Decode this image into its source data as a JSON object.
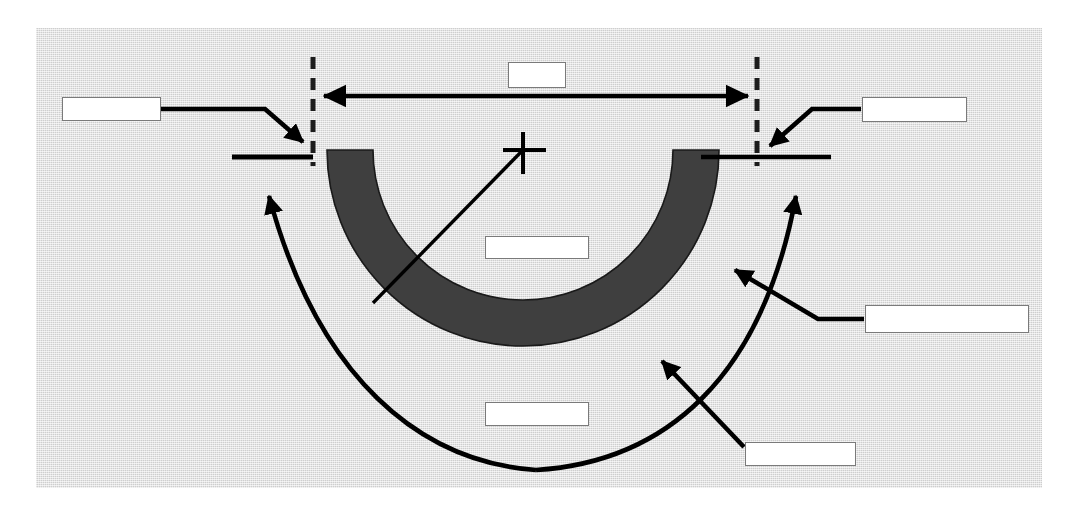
{
  "figure": {
    "type": "labeling-worksheet-diagram",
    "plate_background_color": "#dcdcdc",
    "page_background_color": "#ffffff",
    "band_fill_color": "#3f3f3f",
    "line_color": "#000000",
    "box_fill_color": "#ffffff",
    "box_border_color": "#7a7a7a"
  },
  "geometry": {
    "center_marker": {
      "name": "center-crosshair",
      "x": 523,
      "y": 150
    },
    "arc_band": {
      "center_x": 523,
      "center_y": 150,
      "inner_radius": 150,
      "outer_radius": 196,
      "start_angle_deg": 180,
      "end_angle_deg": 360,
      "description": "U-shaped dark gray circular band (half annulus) opening upward"
    },
    "left_dashed_line": {
      "x": 313,
      "y_top": 57,
      "y_bottom": 163
    },
    "right_dashed_line": {
      "x": 757,
      "y_top": 57,
      "y_bottom": 163
    },
    "left_tick": {
      "x1": 232,
      "x2": 312,
      "y": 157
    },
    "right_tick": {
      "x1": 700,
      "x2": 830,
      "y": 157
    },
    "span_arrow": {
      "x1": 320,
      "x2": 752,
      "y": 96,
      "heads": "both"
    },
    "radius_line": {
      "x1": 523,
      "y1": 150,
      "x2": 375,
      "y2": 302
    }
  },
  "labels": {
    "span_dimension": {
      "name": "span-dimension-box",
      "text": "",
      "x": 508,
      "y": 62,
      "w": 58,
      "h": 26
    },
    "left_springing": {
      "name": "left-springing-box",
      "text": "",
      "x": 62,
      "y": 97,
      "w": 99,
      "h": 24
    },
    "right_springing": {
      "name": "right-springing-box",
      "text": "",
      "x": 862,
      "y": 97,
      "w": 105,
      "h": 25
    },
    "radius_label": {
      "name": "radius-label-box",
      "text": "",
      "x": 485,
      "y": 236,
      "w": 104,
      "h": 23
    },
    "ring_outer": {
      "name": "outer-ring-label-box",
      "text": "",
      "x": 865,
      "y": 305,
      "w": 164,
      "h": 28
    },
    "rise_label": {
      "name": "rise-label-box",
      "text": "",
      "x": 485,
      "y": 402,
      "w": 104,
      "h": 24
    },
    "ring_inner": {
      "name": "inner-ring-label-box",
      "text": "",
      "x": 745,
      "y": 442,
      "w": 111,
      "h": 24
    }
  },
  "leaders": [
    {
      "name": "leader-left-springing",
      "from_box": "left_springing",
      "to": "left abutment / dashed line top"
    },
    {
      "name": "leader-right-springing",
      "from_box": "right_springing",
      "to": "right abutment / dashed line top"
    },
    {
      "name": "leader-outer-ring",
      "from_box": "ring_outer",
      "to": "outer edge of arc band, upper right"
    },
    {
      "name": "leader-inner-ring",
      "from_box": "ring_inner",
      "to": "outer edge of arc band, lower right"
    },
    {
      "name": "leader-rise-left",
      "from_box": "rise_label",
      "to": "left tick mark, curved arc leader"
    },
    {
      "name": "leader-rise-right",
      "from_box": "rise_label",
      "to": "right tick mark, curved arc leader"
    }
  ]
}
